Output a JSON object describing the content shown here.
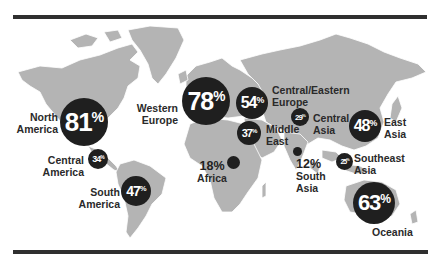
{
  "colors": {
    "land": "#b4b4b4",
    "bubble": "#1f1f1f",
    "bubble_text": "#ffffff",
    "label_text": "#2a2a2a",
    "rule": "#2f2f2f",
    "background": "#ffffff"
  },
  "regions": [
    {
      "id": "north-america",
      "name_line1": "North",
      "name_line2": "America",
      "value": "81",
      "unit": "%"
    },
    {
      "id": "western-europe",
      "name_line1": "Western",
      "name_line2": "Europe",
      "value": "78",
      "unit": "%"
    },
    {
      "id": "central-eastern-europe",
      "name_line1": "Central/Eastern",
      "name_line2": "Europe",
      "value": "54",
      "unit": "%"
    },
    {
      "id": "middle-east",
      "name_line1": "Middle",
      "name_line2": "East",
      "value": "37",
      "unit": "%"
    },
    {
      "id": "central-asia",
      "name_line1": "Central",
      "name_line2": "Asia",
      "value": "29",
      "unit": "%"
    },
    {
      "id": "east-asia",
      "name_line1": "East",
      "name_line2": "Asia",
      "value": "48",
      "unit": "%"
    },
    {
      "id": "central-america",
      "name_line1": "Central",
      "name_line2": "America",
      "value": "34",
      "unit": "%"
    },
    {
      "id": "south-america",
      "name_line1": "South",
      "name_line2": "America",
      "value": "47",
      "unit": "%"
    },
    {
      "id": "africa",
      "name_line1": "Africa",
      "name_line2": "",
      "value": "18%",
      "unit": ""
    },
    {
      "id": "south-asia",
      "name_line1": "South",
      "name_line2": "Asia",
      "value": "12%",
      "unit": ""
    },
    {
      "id": "southeast-asia",
      "name_line1": "Southeast",
      "name_line2": "Asia",
      "value": "25",
      "unit": "%"
    },
    {
      "id": "oceania",
      "name_line1": "Oceania",
      "name_line2": "",
      "value": "63",
      "unit": "%"
    }
  ]
}
